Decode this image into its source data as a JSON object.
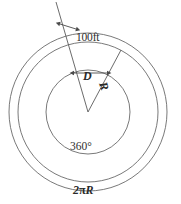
{
  "figure": {
    "background_color": "#ffffff",
    "line_color": "#555555",
    "text_color": "#2f2f2f",
    "width": 181,
    "height": 204,
    "center": {
      "x": 88,
      "y": 112
    },
    "circles": [
      {
        "name": "outer-circle",
        "radius": 79
      },
      {
        "name": "middle-circle",
        "radius": 70
      },
      {
        "name": "inner-circle",
        "radius": 42
      }
    ],
    "sector": {
      "apex": {
        "x": 88,
        "y": 112
      },
      "left_ray_angle_deg": -111,
      "right_ray_angle_deg": -62,
      "left_ray_overshoot": true
    },
    "dimension_arrows": [
      {
        "name": "outer-band-arrow",
        "label": "100ft"
      },
      {
        "name": "inner-gap-arrow",
        "label": "D"
      }
    ],
    "labels": {
      "outer_band": "100ft",
      "sector_width": "D",
      "radius": "R",
      "full_angle": "360°",
      "circumference_value": "2",
      "circumference_pi": "π",
      "circumference_radius": "R",
      "circumference_full": "2πR"
    }
  }
}
